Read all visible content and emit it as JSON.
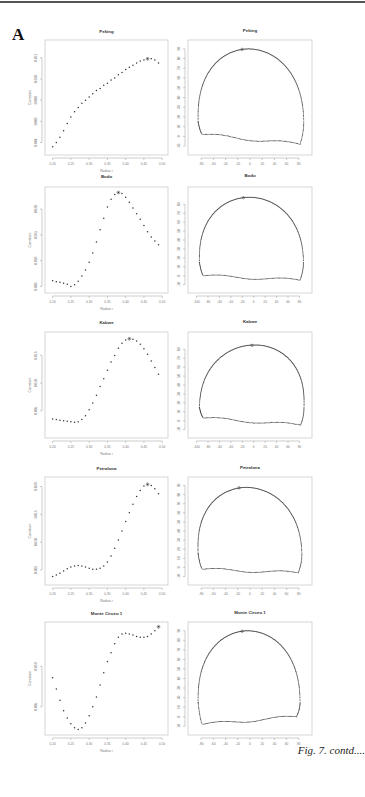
{
  "figure": {
    "panel_label": "A",
    "caption": "Fig. 7. contd...."
  },
  "chart_data": [
    {
      "type": "scatter",
      "title": "Peking",
      "xlabel": "Radius r",
      "ylabel": "Curvature",
      "xlim": [
        0.19,
        0.505
      ],
      "ylim": [
        0.0032,
        0.0133
      ],
      "xticks": [
        0.2,
        0.25,
        0.3,
        0.35,
        0.4,
        0.45,
        0.5
      ],
      "yticks": [
        0.004,
        0.006,
        0.008,
        0.01,
        0.012
      ],
      "x": [
        0.2,
        0.21,
        0.22,
        0.23,
        0.24,
        0.25,
        0.26,
        0.27,
        0.28,
        0.29,
        0.3,
        0.31,
        0.32,
        0.33,
        0.34,
        0.35,
        0.36,
        0.37,
        0.38,
        0.39,
        0.4,
        0.41,
        0.42,
        0.43,
        0.44,
        0.45,
        0.46,
        0.47,
        0.48,
        0.49
      ],
      "y": [
        0.0036,
        0.004,
        0.0045,
        0.0051,
        0.0058,
        0.0064,
        0.0069,
        0.0073,
        0.0077,
        0.008,
        0.0083,
        0.0086,
        0.0089,
        0.0091,
        0.0094,
        0.0096,
        0.0099,
        0.0101,
        0.0104,
        0.0106,
        0.0109,
        0.0111,
        0.0113,
        0.0115,
        0.0117,
        0.0118,
        0.0119,
        0.0119,
        0.0118,
        0.0115
      ],
      "marked_index": 26
    },
    {
      "type": "scatter",
      "title": "Bodo",
      "xlabel": "Radius r",
      "ylabel": "Curvature",
      "xlim": [
        0.19,
        0.505
      ],
      "ylim": [
        0.0045,
        0.0235
      ],
      "xticks": [
        0.2,
        0.25,
        0.3,
        0.35,
        0.4,
        0.45,
        0.5
      ],
      "yticks": [
        0.005,
        0.01,
        0.015,
        0.02
      ],
      "x": [
        0.2,
        0.21,
        0.22,
        0.23,
        0.24,
        0.25,
        0.26,
        0.27,
        0.28,
        0.29,
        0.3,
        0.31,
        0.32,
        0.33,
        0.34,
        0.35,
        0.36,
        0.37,
        0.38,
        0.39,
        0.4,
        0.41,
        0.42,
        0.43,
        0.44,
        0.45,
        0.46,
        0.47,
        0.48,
        0.49
      ],
      "y": [
        0.0061,
        0.0059,
        0.0058,
        0.0056,
        0.0054,
        0.005,
        0.0053,
        0.006,
        0.007,
        0.0082,
        0.0097,
        0.0115,
        0.0136,
        0.016,
        0.0182,
        0.0204,
        0.0219,
        0.0228,
        0.0232,
        0.023,
        0.0223,
        0.0213,
        0.0202,
        0.0191,
        0.018,
        0.0168,
        0.0156,
        0.0146,
        0.0138,
        0.0131
      ],
      "marked_index": 18
    },
    {
      "type": "scatter",
      "title": "Kabwe",
      "xlabel": "Radius r",
      "ylabel": "Curvature",
      "xlim": [
        0.19,
        0.505
      ],
      "ylim": [
        0.0008,
        0.0185
      ],
      "xticks": [
        0.2,
        0.25,
        0.3,
        0.35,
        0.4,
        0.45,
        0.5
      ],
      "yticks": [
        0.005,
        0.01,
        0.015
      ],
      "x": [
        0.2,
        0.21,
        0.22,
        0.23,
        0.24,
        0.25,
        0.26,
        0.27,
        0.28,
        0.29,
        0.3,
        0.31,
        0.32,
        0.33,
        0.34,
        0.35,
        0.36,
        0.37,
        0.38,
        0.39,
        0.4,
        0.41,
        0.42,
        0.43,
        0.44,
        0.45,
        0.46,
        0.47,
        0.48,
        0.49
      ],
      "y": [
        0.0035,
        0.0034,
        0.0033,
        0.0032,
        0.0031,
        0.003,
        0.0029,
        0.003,
        0.0034,
        0.0041,
        0.0052,
        0.0064,
        0.0078,
        0.0094,
        0.0108,
        0.0123,
        0.0138,
        0.015,
        0.0163,
        0.0172,
        0.0178,
        0.018,
        0.0179,
        0.0176,
        0.017,
        0.0162,
        0.0152,
        0.014,
        0.0128,
        0.0116
      ],
      "marked_index": 21
    },
    {
      "type": "scatter",
      "title": "Petralona",
      "xlabel": "Radius r",
      "ylabel": "Curvature",
      "xlim": [
        0.19,
        0.505
      ],
      "ylim": [
        0.003,
        0.021
      ],
      "xticks": [
        0.2,
        0.25,
        0.3,
        0.35,
        0.4,
        0.45,
        0.5
      ],
      "yticks": [
        0.005,
        0.01,
        0.015,
        0.02
      ],
      "x": [
        0.2,
        0.21,
        0.22,
        0.23,
        0.24,
        0.25,
        0.26,
        0.27,
        0.28,
        0.29,
        0.3,
        0.31,
        0.32,
        0.33,
        0.34,
        0.35,
        0.36,
        0.37,
        0.38,
        0.39,
        0.4,
        0.41,
        0.42,
        0.43,
        0.44,
        0.45,
        0.46,
        0.47,
        0.48,
        0.49
      ],
      "y": [
        0.0038,
        0.0041,
        0.0044,
        0.0048,
        0.0052,
        0.0055,
        0.0057,
        0.0058,
        0.0057,
        0.0055,
        0.0053,
        0.0051,
        0.0051,
        0.0053,
        0.0057,
        0.0064,
        0.0075,
        0.0089,
        0.0104,
        0.012,
        0.0137,
        0.0153,
        0.0168,
        0.0182,
        0.0193,
        0.0201,
        0.0204,
        0.0202,
        0.0196,
        0.0187
      ],
      "marked_index": 26
    },
    {
      "type": "scatter",
      "title": "Monte Circeo 1",
      "xlabel": "Radius r",
      "ylabel": "Curvature",
      "xlim": [
        0.19,
        0.505
      ],
      "ylim": [
        0.002,
        0.015
      ],
      "xticks": [
        0.2,
        0.25,
        0.3,
        0.35,
        0.4,
        0.45,
        0.5
      ],
      "yticks": [
        0.005,
        0.01
      ],
      "x": [
        0.2,
        0.21,
        0.22,
        0.23,
        0.24,
        0.25,
        0.26,
        0.27,
        0.28,
        0.29,
        0.3,
        0.31,
        0.32,
        0.33,
        0.34,
        0.35,
        0.36,
        0.37,
        0.38,
        0.39,
        0.4,
        0.41,
        0.42,
        0.43,
        0.44,
        0.45,
        0.46,
        0.47,
        0.48,
        0.49
      ],
      "y": [
        0.0086,
        0.0072,
        0.0058,
        0.0045,
        0.0036,
        0.0029,
        0.0024,
        0.0022,
        0.0024,
        0.003,
        0.0039,
        0.005,
        0.0062,
        0.0077,
        0.0092,
        0.0106,
        0.0117,
        0.0128,
        0.0136,
        0.014,
        0.0141,
        0.014,
        0.0139,
        0.0137,
        0.0136,
        0.0136,
        0.0137,
        0.014,
        0.0144,
        0.0149
      ],
      "marked_index": 29
    }
  ],
  "outlines": [
    {
      "type": "scatter",
      "title": "Peking",
      "xlim": [
        -95,
        95
      ],
      "ylim": [
        -15,
        95
      ],
      "xticks": [
        -80,
        -60,
        -40,
        -20,
        0,
        20,
        40,
        60,
        80
      ],
      "yticks": [
        -10,
        0,
        10,
        20,
        30,
        40,
        50,
        60,
        70,
        80,
        90
      ],
      "shape": {
        "left": -85,
        "right": 88,
        "top": 90,
        "bottom": -8,
        "peak_x": -5,
        "left_low": 2,
        "right_low": -8
      }
    },
    {
      "type": "scatter",
      "title": "Bodo",
      "xlim": [
        -108,
        95
      ],
      "ylim": [
        -15,
        95
      ],
      "xticks": [
        -100,
        -80,
        -60,
        -40,
        -20,
        0,
        20,
        40,
        60,
        80
      ],
      "yticks": [
        -10,
        0,
        10,
        20,
        30,
        40,
        50,
        60,
        70,
        80
      ],
      "shape": {
        "left": -95,
        "right": 87,
        "top": 88,
        "bottom": -5,
        "peak_x": -10,
        "left_low": 0,
        "right_low": -5
      }
    },
    {
      "type": "scatter",
      "title": "Kabwe",
      "xlim": [
        -108,
        95
      ],
      "ylim": [
        -15,
        95
      ],
      "xticks": [
        -100,
        -80,
        -60,
        -40,
        -20,
        0,
        20,
        40,
        60,
        80
      ],
      "yticks": [
        -10,
        0,
        10,
        20,
        30,
        40,
        50,
        60,
        70,
        80
      ],
      "shape": {
        "left": -95,
        "right": 88,
        "top": 85,
        "bottom": -5,
        "peak_x": 5,
        "left_low": 3,
        "right_low": -5
      }
    },
    {
      "type": "scatter",
      "title": "Petralona",
      "xlim": [
        -95,
        95
      ],
      "ylim": [
        -15,
        95
      ],
      "xticks": [
        -80,
        -60,
        -40,
        -20,
        0,
        20,
        40,
        60,
        80
      ],
      "yticks": [
        -10,
        0,
        10,
        20,
        30,
        40,
        50,
        60,
        70,
        80,
        90
      ],
      "shape": {
        "left": -85,
        "right": 85,
        "top": 88,
        "bottom": -6,
        "peak_x": -10,
        "left_low": -2,
        "right_low": -6
      }
    },
    {
      "type": "scatter",
      "title": "Monte Circeo 1",
      "xlim": [
        -95,
        95
      ],
      "ylim": [
        -15,
        95
      ],
      "xticks": [
        -80,
        -60,
        -40,
        -20,
        0,
        20,
        40,
        60,
        80
      ],
      "yticks": [
        -10,
        0,
        10,
        20,
        30,
        40,
        50,
        60,
        70,
        80,
        90
      ],
      "shape": {
        "left": -85,
        "right": 82,
        "top": 90,
        "bottom": -8,
        "peak_x": -5,
        "left_low": -8,
        "right_low": 0
      }
    }
  ]
}
